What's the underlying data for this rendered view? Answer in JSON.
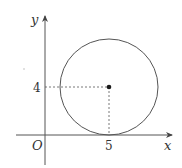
{
  "diagram": {
    "type": "coordinate-plane-circle",
    "axes": {
      "x_label": "x",
      "y_label": "y",
      "origin_label": "O"
    },
    "circle": {
      "center": [
        5,
        4
      ],
      "radius": 4,
      "tangent_to": "x-axis"
    },
    "ticks": {
      "x_tick_label": "5",
      "y_tick_label": "4"
    },
    "colors": {
      "stroke": "#555555",
      "text": "#333333",
      "dot": "#1a1a1a"
    }
  }
}
